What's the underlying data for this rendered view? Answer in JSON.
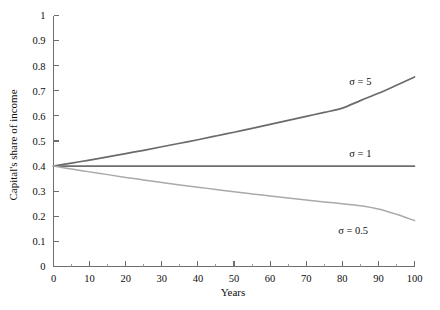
{
  "chart_data": {
    "type": "line",
    "title": "",
    "xlabel": "Years",
    "ylabel": "Capital's share of income",
    "xlim": [
      0,
      100
    ],
    "ylim": [
      0,
      1
    ],
    "grid": false,
    "legend_position": "inline-annotations",
    "x_ticks": [
      0,
      10,
      20,
      30,
      40,
      50,
      60,
      70,
      80,
      90,
      100
    ],
    "x_tick_labels": [
      "0",
      "10",
      "20",
      "30",
      "40",
      "50",
      "60",
      "70",
      "80",
      "90",
      "100"
    ],
    "x_minor_ticks": [
      5,
      15,
      25,
      35,
      45,
      55,
      65,
      75,
      85,
      95
    ],
    "y_ticks": [
      0,
      0.1,
      0.2,
      0.3,
      0.4,
      0.5,
      0.6,
      0.7,
      0.8,
      0.9,
      1
    ],
    "y_tick_labels": [
      "0",
      "0.1",
      "0.2",
      "0.3",
      "0.4",
      "0.5",
      "0.6",
      "0.7",
      "0.8",
      "0.9",
      "1"
    ],
    "x": [
      0,
      5,
      10,
      15,
      20,
      25,
      30,
      35,
      40,
      45,
      50,
      55,
      60,
      65,
      70,
      75,
      80,
      85,
      90,
      95,
      100
    ],
    "series": [
      {
        "name": "sigma-5",
        "label": "σ = 5",
        "color": "#6b6b6b",
        "linewidth": 1.7,
        "label_x": 85,
        "label_y": 0.725,
        "values": [
          0.4,
          0.412,
          0.424,
          0.437,
          0.45,
          0.463,
          0.477,
          0.491,
          0.505,
          0.52,
          0.535,
          0.55,
          0.566,
          0.582,
          0.598,
          0.614,
          0.631,
          0.661,
          0.69,
          0.722,
          0.755
        ]
      },
      {
        "name": "sigma-1",
        "label": "σ = 1",
        "color": "#6e6e6e",
        "linewidth": 1.7,
        "label_x": 85,
        "label_y": 0.435,
        "values": [
          0.4,
          0.4,
          0.4,
          0.4,
          0.4,
          0.4,
          0.4,
          0.4,
          0.4,
          0.4,
          0.4,
          0.4,
          0.4,
          0.4,
          0.4,
          0.4,
          0.4,
          0.4,
          0.4,
          0.4,
          0.4
        ]
      },
      {
        "name": "sigma-0-5",
        "label": "σ = 0.5",
        "color": "#a9a9a9",
        "linewidth": 1.5,
        "label_x": 83,
        "label_y": 0.128,
        "values": [
          0.4,
          0.388,
          0.377,
          0.366,
          0.355,
          0.345,
          0.335,
          0.325,
          0.316,
          0.307,
          0.298,
          0.289,
          0.281,
          0.273,
          0.265,
          0.257,
          0.25,
          0.242,
          0.229,
          0.208,
          0.183
        ]
      }
    ]
  },
  "axes_style": {
    "axis_color": "#6e6e6e",
    "text_color": "#0d0d0d",
    "background": "#ffffff"
  }
}
